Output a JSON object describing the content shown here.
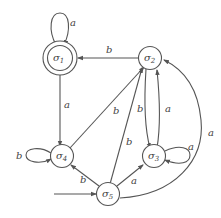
{
  "diagram": {
    "type": "finite-state-automaton",
    "states": [
      {
        "id": "s1",
        "symbol": "σ",
        "sub": "1",
        "accepting": true,
        "start": false
      },
      {
        "id": "s2",
        "symbol": "σ",
        "sub": "2",
        "accepting": false,
        "start": false
      },
      {
        "id": "s3",
        "symbol": "σ",
        "sub": "3",
        "accepting": false,
        "start": false
      },
      {
        "id": "s4",
        "symbol": "σ",
        "sub": "4",
        "accepting": false,
        "start": false
      },
      {
        "id": "s5",
        "symbol": "σ",
        "sub": "5",
        "accepting": false,
        "start": true
      }
    ],
    "transitions": [
      {
        "from": "s1",
        "to": "s1",
        "label": "a"
      },
      {
        "from": "s2",
        "to": "s1",
        "label": "b"
      },
      {
        "from": "s1",
        "to": "s4",
        "label": "a"
      },
      {
        "from": "s4",
        "to": "s4",
        "label": "b"
      },
      {
        "from": "s4",
        "to": "s2",
        "label": "b"
      },
      {
        "from": "s2",
        "to": "s3",
        "label": "b"
      },
      {
        "from": "s3",
        "to": "s2",
        "label": "a"
      },
      {
        "from": "s3",
        "to": "s3",
        "label": "a"
      },
      {
        "from": "s5",
        "to": "s4",
        "label": "b"
      },
      {
        "from": "s5",
        "to": "s2",
        "label": "b"
      },
      {
        "from": "s5",
        "to": "s3",
        "label": "a"
      },
      {
        "from": "s5",
        "to": "s2",
        "label": "a"
      }
    ]
  },
  "labels": {
    "l_s1_loop": "a",
    "l_s2_s1": "b",
    "l_s1_s4": "a",
    "l_s4_loop": "b",
    "l_s4_s2": "b",
    "l_s2_s3": "b",
    "l_s3_s2": "a",
    "l_s3_loop": "a",
    "l_s5_s4": "b",
    "l_s5_s2": "b",
    "l_s5_s3": "a",
    "l_s5_s2_curve": "a",
    "sigma": "σ",
    "s1": "1",
    "s2": "2",
    "s3": "3",
    "s4": "4",
    "s5": "5"
  }
}
